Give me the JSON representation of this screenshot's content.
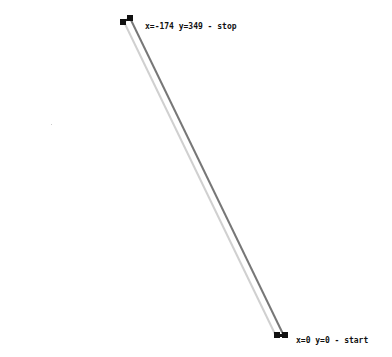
{
  "diagram": {
    "stop_point": {
      "x": -174,
      "y": 349,
      "label": "x=-174 y=349 - stop"
    },
    "start_point": {
      "x": 0,
      "y": 0,
      "label": "x=0 y=0 - start"
    },
    "colors": {
      "main_line": "#777777",
      "shadow_line": "#d0d0d0",
      "endpoint": "#111111",
      "text": "#111111",
      "background": "#ffffff"
    }
  }
}
